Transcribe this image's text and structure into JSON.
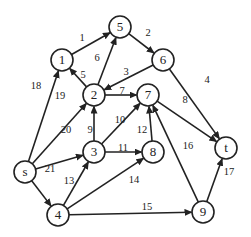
{
  "graph": {
    "nodes": [
      {
        "id": "s",
        "label": "s",
        "x": 25,
        "y": 172
      },
      {
        "id": "1",
        "label": "1",
        "x": 62,
        "y": 60
      },
      {
        "id": "5",
        "label": "5",
        "x": 120,
        "y": 27
      },
      {
        "id": "6",
        "label": "6",
        "x": 163,
        "y": 60
      },
      {
        "id": "2",
        "label": "2",
        "x": 94,
        "y": 95
      },
      {
        "id": "7",
        "label": "7",
        "x": 148,
        "y": 95
      },
      {
        "id": "t",
        "label": "t",
        "x": 226,
        "y": 148
      },
      {
        "id": "3",
        "label": "3",
        "x": 94,
        "y": 152
      },
      {
        "id": "8",
        "label": "8",
        "x": 153,
        "y": 152
      },
      {
        "id": "4",
        "label": "4",
        "x": 58,
        "y": 215
      },
      {
        "id": "9",
        "label": "9",
        "x": 203,
        "y": 212
      }
    ],
    "edges": [
      {
        "from": "1",
        "to": "5",
        "label": "1",
        "lx": 82,
        "ly": 39
      },
      {
        "from": "5",
        "to": "6",
        "label": "2",
        "lx": 148,
        "ly": 34
      },
      {
        "from": "6",
        "to": "2",
        "label": "3",
        "lx": 126,
        "ly": 73
      },
      {
        "from": "6",
        "to": "t",
        "label": "4",
        "lx": 207,
        "ly": 81
      },
      {
        "from": "2",
        "to": "1",
        "label": "5",
        "lx": 83,
        "ly": 76
      },
      {
        "from": "2",
        "to": "5",
        "label": "6",
        "lx": 97,
        "ly": 59
      },
      {
        "from": "2",
        "to": "7",
        "label": "7",
        "lx": 122,
        "ly": 92
      },
      {
        "from": "7",
        "to": "t",
        "label": "8",
        "lx": 185,
        "ly": 101
      },
      {
        "from": "3",
        "to": "2",
        "label": "9",
        "lx": 90,
        "ly": 131
      },
      {
        "from": "3",
        "to": "7",
        "label": "10",
        "lx": 120,
        "ly": 121
      },
      {
        "from": "3",
        "to": "8",
        "label": "11",
        "lx": 123,
        "ly": 149
      },
      {
        "from": "8",
        "to": "7",
        "label": "12",
        "lx": 142,
        "ly": 131
      },
      {
        "from": "4",
        "to": "3",
        "label": "13",
        "lx": 69,
        "ly": 182
      },
      {
        "from": "4",
        "to": "8",
        "label": "14",
        "lx": 134,
        "ly": 181
      },
      {
        "from": "4",
        "to": "9",
        "label": "15",
        "lx": 147,
        "ly": 208
      },
      {
        "from": "9",
        "to": "7",
        "label": "16",
        "lx": 188,
        "ly": 147
      },
      {
        "from": "9",
        "to": "t",
        "label": "17",
        "lx": 229,
        "ly": 173
      },
      {
        "from": "s",
        "to": "1",
        "label": "18",
        "lx": 36,
        "ly": 87
      },
      {
        "from": "s",
        "to": "2",
        "label": "19",
        "lx": 60,
        "ly": 97
      },
      {
        "from": "s",
        "to": "3",
        "label": "20",
        "lx": 66,
        "ly": 131
      },
      {
        "from": "s",
        "to": "4",
        "label": "21",
        "lx": 50,
        "ly": 170
      }
    ]
  },
  "style": {
    "node_radius": 11,
    "stroke": "#222222"
  }
}
